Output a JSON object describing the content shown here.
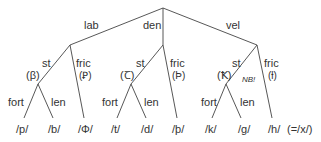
{
  "diagram": {
    "branches": {
      "lab": "lab",
      "den": "den",
      "vel": "vel"
    },
    "labial": {
      "st": "st",
      "st_sym": "(β)",
      "fric": "fric",
      "fric_sym": "(Ꝑ)",
      "fort": "fort",
      "len": "len",
      "leaf_p": "/p/",
      "leaf_b": "/b/",
      "leaf_phi": "/Φ/"
    },
    "dental": {
      "st": "st",
      "st_sym": "(Ꞇ)",
      "fric": "fric",
      "fric_sym": "(Þ)",
      "fort": "fort",
      "len": "len",
      "leaf_t": "/t/",
      "leaf_d": "/d/",
      "leaf_thorn": "/þ/"
    },
    "velar": {
      "st": "st",
      "st_sym": "(Ꝁ)",
      "note": "NB!",
      "fric": "fric",
      "fric_sym": "(ƚ)",
      "fort": "fort",
      "len": "len",
      "leaf_k": "/k/",
      "leaf_g": "/g/",
      "leaf_h": "/h/",
      "leaf_h_note": "(=/x/)"
    }
  }
}
